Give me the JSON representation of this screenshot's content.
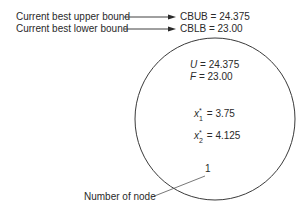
{
  "labels": {
    "upper_bound_label": "Current best upper bound",
    "lower_bound_label": "Current best lower bound",
    "node_number_label": "Number of node"
  },
  "bounds": {
    "cbub": "CBUB = 24.375",
    "cblb": "CBLB = 23.00"
  },
  "node": {
    "u_var": "U",
    "u_value": " = 24.375",
    "f_var": "F",
    "f_value": " = 23.00",
    "x1_var": "x",
    "x1_sub": "1",
    "x1_sup": "*",
    "x1_value": " = 3.75",
    "x2_var": "x",
    "x2_sub": "2",
    "x2_sup": "*",
    "x2_value": " = 4.125",
    "number": "1"
  }
}
